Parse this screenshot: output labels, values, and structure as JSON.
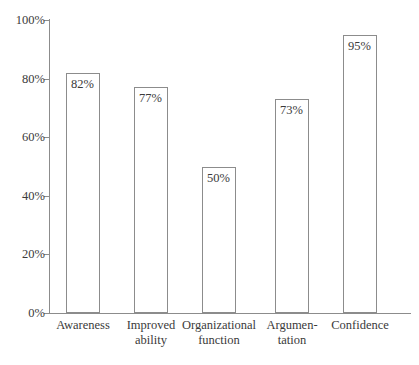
{
  "chart_data": {
    "type": "bar",
    "title": "",
    "subtitle": "",
    "xlabel": "",
    "ylabel": "",
    "categories": [
      "Awareness",
      "Improved\nability",
      "Organizational\nfunction",
      "Argumen-\ntation",
      "Confidence"
    ],
    "values": [
      82,
      77,
      50,
      73,
      95
    ],
    "value_labels": [
      "82%",
      "77%",
      "50%",
      "73%",
      "95%"
    ],
    "ylim": [
      0,
      100
    ],
    "ytick_values": [
      0,
      20,
      40,
      60,
      80,
      100
    ],
    "ytick_labels": [
      "0%",
      "20%",
      "40%",
      "60%",
      "80%",
      "100%"
    ],
    "grid": false,
    "legend": null,
    "legend_position": "none",
    "series": [
      {
        "name": "Percentage",
        "values": [
          82,
          77,
          50,
          73,
          95
        ]
      }
    ]
  },
  "style": {
    "background": "#ffffff",
    "axis_color": "#8c8c8c",
    "bar_fill": "#ffffff",
    "bar_stroke": "#8c8c8c",
    "text_color": "#3a3a3a"
  }
}
